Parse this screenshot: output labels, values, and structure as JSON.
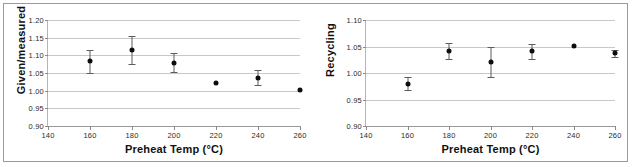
{
  "figure": {
    "panel_count": 2,
    "border_color": "#9a9a9a",
    "background": "#ffffff"
  },
  "chart_data": [
    {
      "type": "scatter",
      "id": "given-measured",
      "title": "",
      "xlabel": "Preheat Temp (°C)",
      "ylabel": "Given/measured",
      "xlim": [
        140,
        260
      ],
      "ylim": [
        0.9,
        1.2
      ],
      "xticks": [
        140,
        160,
        180,
        200,
        220,
        240,
        260
      ],
      "yticks": [
        0.9,
        0.95,
        1.0,
        1.05,
        1.1,
        1.15,
        1.2
      ],
      "xtick_labels": [
        "140",
        "160",
        "180",
        "200",
        "220",
        "240",
        "260"
      ],
      "ytick_labels": [
        "0.90",
        "0.95",
        "1.00",
        "1.05",
        "1.10",
        "1.15",
        "1.20"
      ],
      "grid": true,
      "legend": "none",
      "marker": "filled-circle",
      "marker_color": "#0d0d0d",
      "errorbar_color": "#5c5c5c",
      "x": [
        160,
        180,
        200,
        220,
        240,
        260
      ],
      "values": [
        1.083,
        1.116,
        1.079,
        1.022,
        1.037,
        1.002
      ],
      "yerr": [
        0.032,
        0.04,
        0.027,
        0.0,
        0.022,
        0.0
      ]
    },
    {
      "type": "scatter",
      "id": "recycling",
      "title": "",
      "xlabel": "Preheat Temp (°C)",
      "ylabel": "Recycling",
      "xlim": [
        140,
        260
      ],
      "ylim": [
        0.9,
        1.1
      ],
      "xticks": [
        140,
        160,
        180,
        200,
        220,
        240,
        260
      ],
      "yticks": [
        0.9,
        0.95,
        1.0,
        1.05,
        1.1
      ],
      "xtick_labels": [
        "140",
        "160",
        "180",
        "200",
        "220",
        "240",
        "260"
      ],
      "ytick_labels": [
        "0.90",
        "0.95",
        "1.00",
        "1.05",
        "1.10"
      ],
      "grid": true,
      "legend": "none",
      "marker": "filled-circle",
      "marker_color": "#0d0d0d",
      "errorbar_color": "#5c5c5c",
      "x": [
        160,
        180,
        200,
        220,
        240,
        260
      ],
      "values": [
        0.98,
        1.041,
        1.021,
        1.041,
        1.051,
        1.037
      ],
      "yerr": [
        0.013,
        0.015,
        0.028,
        0.014,
        0.0,
        0.006
      ]
    }
  ]
}
